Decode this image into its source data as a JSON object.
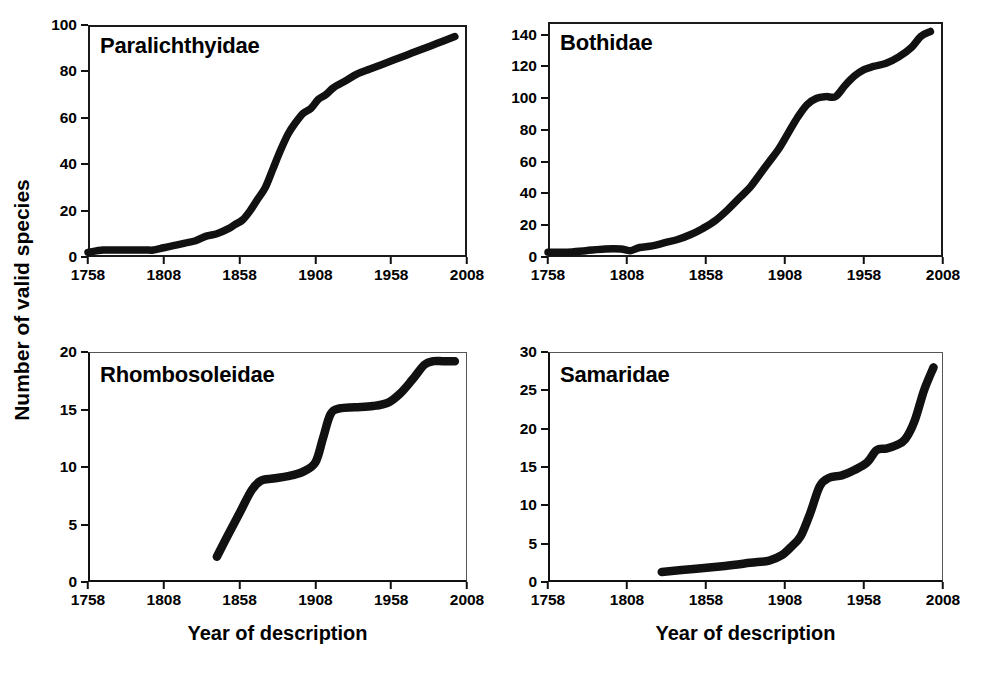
{
  "figure": {
    "y_axis_title": "Number of valid species",
    "x_axis_title": "Year of description"
  },
  "axis_titles": {
    "bottom_left": "Year of description",
    "bottom_right": "Year of description"
  },
  "chart_data": [
    {
      "type": "line",
      "title": "Paralichthyidae",
      "xlabel": "Year of description",
      "ylabel": "Number of valid species",
      "xlim": [
        1758,
        2008
      ],
      "ylim": [
        0,
        100
      ],
      "xticks": [
        1758,
        1808,
        1858,
        1908,
        1958,
        2008
      ],
      "yticks": [
        0,
        20,
        40,
        60,
        80,
        100
      ],
      "grid": false,
      "legend": "none",
      "x": [
        1758,
        1768,
        1778,
        1788,
        1798,
        1801,
        1808,
        1815,
        1822,
        1829,
        1836,
        1843,
        1850,
        1855,
        1860,
        1865,
        1870,
        1875,
        1880,
        1885,
        1890,
        1895,
        1900,
        1905,
        1910,
        1915,
        1920,
        1928,
        1936,
        1944,
        1952,
        1960,
        1968,
        1976,
        1984,
        1992,
        2000
      ],
      "y": [
        2,
        3,
        3,
        3,
        3,
        3,
        4,
        5,
        6,
        7,
        9,
        10,
        12,
        14,
        16,
        20,
        25,
        30,
        38,
        46,
        53,
        58,
        62,
        64,
        68,
        70,
        73,
        76,
        79,
        81,
        83,
        85,
        87,
        89,
        91,
        93,
        95
      ]
    },
    {
      "type": "line",
      "title": "Bothidae",
      "xlabel": "Year of description",
      "ylabel": "Number of valid species",
      "xlim": [
        1758,
        2008
      ],
      "ylim": [
        0,
        148
      ],
      "xticks": [
        1758,
        1808,
        1858,
        1908,
        1958,
        2008
      ],
      "yticks": [
        0,
        20,
        40,
        60,
        80,
        100,
        120,
        140
      ],
      "grid": false,
      "legend": "none",
      "x": [
        1758,
        1770,
        1782,
        1794,
        1804,
        1810,
        1816,
        1824,
        1832,
        1840,
        1848,
        1856,
        1864,
        1872,
        1880,
        1886,
        1892,
        1898,
        1904,
        1910,
        1916,
        1922,
        1928,
        1934,
        1940,
        1946,
        1952,
        1958,
        1964,
        1972,
        1980,
        1988,
        1994,
        2000
      ],
      "y": [
        3,
        3,
        4,
        5,
        5,
        4,
        6,
        7,
        9,
        11,
        14,
        18,
        23,
        30,
        38,
        44,
        52,
        60,
        68,
        78,
        88,
        96,
        100,
        101,
        101,
        108,
        114,
        118,
        120,
        122,
        126,
        132,
        139,
        142
      ]
    },
    {
      "type": "line",
      "title": "Rhombosoleidae",
      "xlabel": "Year of description",
      "ylabel": "Number of valid species",
      "xlim": [
        1758,
        2008
      ],
      "ylim": [
        0,
        20
      ],
      "xticks": [
        1758,
        1808,
        1858,
        1908,
        1958,
        2008
      ],
      "yticks": [
        0,
        5,
        10,
        15,
        20
      ],
      "grid": false,
      "legend": "none",
      "x": [
        1843,
        1850,
        1858,
        1866,
        1872,
        1880,
        1890,
        1900,
        1908,
        1913,
        1918,
        1924,
        1934,
        1946,
        1956,
        1964,
        1972,
        1980,
        1986,
        1992,
        2000
      ],
      "y": [
        2.2,
        4.0,
        6.0,
        8.0,
        8.8,
        9.0,
        9.2,
        9.6,
        10.4,
        12.5,
        14.6,
        15.1,
        15.2,
        15.3,
        15.6,
        16.4,
        17.6,
        18.9,
        19.2,
        19.2,
        19.2
      ]
    },
    {
      "type": "line",
      "title": "Samaridae",
      "xlabel": "Year of description",
      "ylabel": "Number of valid species",
      "xlim": [
        1758,
        2008
      ],
      "ylim": [
        0,
        30
      ],
      "xticks": [
        1758,
        1808,
        1858,
        1908,
        1958,
        2008
      ],
      "yticks": [
        0,
        5,
        10,
        15,
        20,
        25,
        30
      ],
      "grid": false,
      "legend": "none",
      "x": [
        1830,
        1850,
        1870,
        1886,
        1898,
        1906,
        1912,
        1918,
        1924,
        1930,
        1936,
        1944,
        1952,
        1960,
        1966,
        1972,
        1978,
        1984,
        1990,
        1996,
        2002
      ],
      "y": [
        1.3,
        1.7,
        2.1,
        2.5,
        2.8,
        3.5,
        4.6,
        6.0,
        9.0,
        12.5,
        13.6,
        13.9,
        14.6,
        15.6,
        17.2,
        17.4,
        17.8,
        18.6,
        21.0,
        25.0,
        28.0
      ]
    }
  ],
  "panels": [
    {
      "id": "paralichthyidae",
      "title": "Paralichthyidae",
      "ytick_labels": [
        "0",
        "20",
        "40",
        "60",
        "80",
        "100"
      ],
      "xtick_labels": [
        "1758",
        "1808",
        "1858",
        "1908",
        "1958",
        "2008"
      ]
    },
    {
      "id": "bothidae",
      "title": "Bothidae",
      "ytick_labels": [
        "0",
        "20",
        "40",
        "60",
        "80",
        "100",
        "120",
        "140"
      ],
      "xtick_labels": [
        "1758",
        "1808",
        "1858",
        "1908",
        "1958",
        "2008"
      ]
    },
    {
      "id": "rhombosoleidae",
      "title": "Rhombosoleidae",
      "ytick_labels": [
        "0",
        "5",
        "10",
        "15",
        "20"
      ],
      "xtick_labels": [
        "1758",
        "1808",
        "1858",
        "1908",
        "1958",
        "2008"
      ]
    },
    {
      "id": "samaridae",
      "title": "Samaridae",
      "ytick_labels": [
        "0",
        "5",
        "10",
        "15",
        "20",
        "25",
        "30"
      ],
      "xtick_labels": [
        "1758",
        "1808",
        "1858",
        "1908",
        "1958",
        "2008"
      ]
    }
  ],
  "colors": {
    "curve": "#111111",
    "axis": "#111111",
    "background": "#ffffff"
  }
}
